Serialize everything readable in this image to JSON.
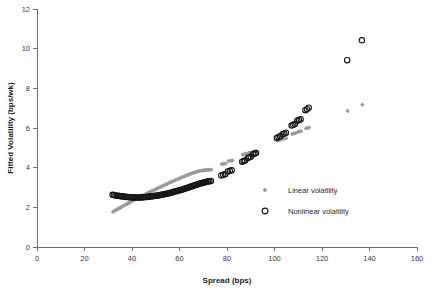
{
  "chart_data": {
    "type": "scatter",
    "title": "",
    "xlabel": "Spread (bps)",
    "ylabel": "Fitted Volatility (bps/wk)",
    "xlim": [
      0,
      160
    ],
    "ylim": [
      0,
      12
    ],
    "xticks": [
      0,
      20,
      40,
      60,
      80,
      100,
      120,
      140,
      160
    ],
    "yticks": [
      0,
      2,
      4,
      6,
      8,
      10,
      12
    ],
    "grid": false,
    "legend_position": "inside-lower-right",
    "series": [
      {
        "name": "Linear volatility",
        "marker": "diamond",
        "color": "#9a9a9a",
        "points": [
          [
            32.0,
            1.77
          ],
          [
            32.6,
            1.82
          ],
          [
            33.2,
            1.86
          ],
          [
            33.8,
            1.9
          ],
          [
            34.4,
            1.94
          ],
          [
            35.0,
            1.98
          ],
          [
            35.6,
            2.02
          ],
          [
            36.2,
            2.06
          ],
          [
            36.8,
            2.1
          ],
          [
            37.4,
            2.14
          ],
          [
            38.0,
            2.18
          ],
          [
            38.6,
            2.22
          ],
          [
            39.2,
            2.26
          ],
          [
            39.8,
            2.3
          ],
          [
            40.4,
            2.34
          ],
          [
            41.0,
            2.38
          ],
          [
            41.6,
            2.42
          ],
          [
            42.2,
            2.45
          ],
          [
            42.8,
            2.49
          ],
          [
            43.4,
            2.53
          ],
          [
            44.0,
            2.56
          ],
          [
            44.6,
            2.6
          ],
          [
            45.2,
            2.63
          ],
          [
            45.8,
            2.67
          ],
          [
            46.4,
            2.7
          ],
          [
            47.0,
            2.74
          ],
          [
            47.6,
            2.77
          ],
          [
            48.2,
            2.81
          ],
          [
            48.8,
            2.84
          ],
          [
            49.4,
            2.88
          ],
          [
            50.0,
            2.91
          ],
          [
            50.6,
            2.95
          ],
          [
            51.2,
            2.98
          ],
          [
            51.8,
            3.02
          ],
          [
            52.4,
            3.05
          ],
          [
            53.0,
            3.08
          ],
          [
            53.6,
            3.12
          ],
          [
            54.2,
            3.15
          ],
          [
            54.8,
            3.18
          ],
          [
            55.4,
            3.22
          ],
          [
            56.0,
            3.25
          ],
          [
            56.6,
            3.28
          ],
          [
            57.2,
            3.31
          ],
          [
            57.8,
            3.35
          ],
          [
            58.4,
            3.38
          ],
          [
            59.0,
            3.41
          ],
          [
            59.6,
            3.44
          ],
          [
            60.2,
            3.47
          ],
          [
            60.8,
            3.5
          ],
          [
            61.4,
            3.53
          ],
          [
            62.0,
            3.56
          ],
          [
            62.6,
            3.59
          ],
          [
            63.2,
            3.62
          ],
          [
            63.8,
            3.65
          ],
          [
            64.4,
            3.68
          ],
          [
            65.0,
            3.7
          ],
          [
            65.6,
            3.73
          ],
          [
            66.2,
            3.75
          ],
          [
            66.8,
            3.78
          ],
          [
            67.4,
            3.8
          ],
          [
            68.0,
            3.82
          ],
          [
            68.6,
            3.84
          ],
          [
            69.2,
            3.85
          ],
          [
            69.8,
            3.86
          ],
          [
            70.4,
            3.87
          ],
          [
            71.0,
            3.88
          ],
          [
            71.6,
            3.88
          ],
          [
            72.2,
            3.89
          ],
          [
            72.8,
            3.89
          ],
          [
            73.4,
            3.9
          ],
          [
            77.8,
            4.18
          ],
          [
            78.6,
            4.2
          ],
          [
            79.4,
            4.21
          ],
          [
            80.6,
            4.33
          ],
          [
            81.4,
            4.35
          ],
          [
            82.2,
            4.36
          ],
          [
            86.6,
            4.66
          ],
          [
            87.2,
            4.68
          ],
          [
            87.8,
            4.7
          ],
          [
            89.0,
            4.74
          ],
          [
            89.6,
            4.76
          ],
          [
            90.2,
            4.77
          ],
          [
            91.2,
            4.8
          ],
          [
            91.8,
            4.81
          ],
          [
            92.4,
            4.82
          ],
          [
            101.2,
            5.37
          ],
          [
            101.9,
            5.39
          ],
          [
            102.6,
            5.41
          ],
          [
            103.6,
            5.45
          ],
          [
            104.3,
            5.47
          ],
          [
            105.0,
            5.49
          ],
          [
            107.4,
            5.7
          ],
          [
            108.1,
            5.72
          ],
          [
            108.8,
            5.74
          ],
          [
            109.8,
            5.8
          ],
          [
            110.5,
            5.82
          ],
          [
            111.2,
            5.84
          ],
          [
            113.2,
            5.98
          ],
          [
            113.9,
            6.0
          ],
          [
            114.6,
            6.02
          ],
          [
            130.8,
            6.86
          ],
          [
            137.0,
            7.17
          ]
        ]
      },
      {
        "name": "Nonlinear volatility",
        "marker": "open-circle",
        "color": "#151515",
        "points": [
          [
            31.8,
            2.63
          ],
          [
            32.4,
            2.62
          ],
          [
            33.0,
            2.6
          ],
          [
            33.6,
            2.59
          ],
          [
            34.2,
            2.58
          ],
          [
            34.8,
            2.57
          ],
          [
            35.4,
            2.56
          ],
          [
            36.0,
            2.55
          ],
          [
            36.6,
            2.54
          ],
          [
            37.2,
            2.53
          ],
          [
            37.8,
            2.52
          ],
          [
            38.4,
            2.52
          ],
          [
            39.0,
            2.51
          ],
          [
            39.6,
            2.51
          ],
          [
            40.2,
            2.5
          ],
          [
            40.8,
            2.5
          ],
          [
            41.4,
            2.5
          ],
          [
            42.0,
            2.5
          ],
          [
            42.6,
            2.5
          ],
          [
            43.2,
            2.5
          ],
          [
            43.8,
            2.5
          ],
          [
            44.4,
            2.51
          ],
          [
            45.0,
            2.51
          ],
          [
            45.6,
            2.52
          ],
          [
            46.2,
            2.52
          ],
          [
            46.8,
            2.53
          ],
          [
            47.4,
            2.54
          ],
          [
            48.0,
            2.55
          ],
          [
            48.6,
            2.56
          ],
          [
            49.2,
            2.57
          ],
          [
            49.8,
            2.58
          ],
          [
            50.4,
            2.59
          ],
          [
            51.0,
            2.6
          ],
          [
            51.6,
            2.61
          ],
          [
            52.2,
            2.63
          ],
          [
            52.8,
            2.64
          ],
          [
            53.4,
            2.66
          ],
          [
            54.0,
            2.67
          ],
          [
            54.6,
            2.69
          ],
          [
            55.2,
            2.7
          ],
          [
            55.8,
            2.72
          ],
          [
            56.4,
            2.74
          ],
          [
            57.0,
            2.76
          ],
          [
            57.6,
            2.78
          ],
          [
            58.2,
            2.8
          ],
          [
            58.8,
            2.82
          ],
          [
            59.4,
            2.84
          ],
          [
            60.0,
            2.86
          ],
          [
            60.6,
            2.88
          ],
          [
            61.2,
            2.9
          ],
          [
            61.8,
            2.92
          ],
          [
            62.4,
            2.95
          ],
          [
            63.0,
            2.97
          ],
          [
            63.6,
            2.99
          ],
          [
            64.2,
            3.02
          ],
          [
            64.8,
            3.04
          ],
          [
            65.4,
            3.07
          ],
          [
            66.0,
            3.09
          ],
          [
            66.6,
            3.12
          ],
          [
            67.2,
            3.14
          ],
          [
            67.8,
            3.17
          ],
          [
            68.4,
            3.19
          ],
          [
            69.0,
            3.21
          ],
          [
            69.6,
            3.23
          ],
          [
            70.2,
            3.25
          ],
          [
            70.8,
            3.27
          ],
          [
            71.4,
            3.29
          ],
          [
            72.0,
            3.3
          ],
          [
            72.6,
            3.32
          ],
          [
            73.2,
            3.33
          ],
          [
            77.6,
            3.61
          ],
          [
            78.4,
            3.64
          ],
          [
            79.2,
            3.67
          ],
          [
            80.4,
            3.81
          ],
          [
            81.2,
            3.84
          ],
          [
            82.0,
            3.87
          ],
          [
            86.4,
            4.3
          ],
          [
            87.0,
            4.33
          ],
          [
            87.6,
            4.36
          ],
          [
            88.8,
            4.49
          ],
          [
            89.4,
            4.52
          ],
          [
            90.0,
            4.55
          ],
          [
            91.0,
            4.68
          ],
          [
            91.6,
            4.71
          ],
          [
            92.2,
            4.74
          ],
          [
            101.0,
            5.5
          ],
          [
            101.7,
            5.54
          ],
          [
            102.4,
            5.58
          ],
          [
            103.4,
            5.68
          ],
          [
            104.1,
            5.72
          ],
          [
            104.8,
            5.76
          ],
          [
            107.2,
            6.12
          ],
          [
            107.9,
            6.16
          ],
          [
            108.6,
            6.2
          ],
          [
            109.6,
            6.36
          ],
          [
            110.3,
            6.4
          ],
          [
            111.0,
            6.44
          ],
          [
            113.0,
            6.9
          ],
          [
            113.7,
            6.95
          ],
          [
            114.4,
            7.02
          ],
          [
            130.6,
            9.42
          ],
          [
            136.8,
            10.42
          ]
        ]
      }
    ]
  },
  "legend": {
    "items": [
      {
        "label": "Linear volatility",
        "marker": "diamond",
        "color": "#9a9a9a"
      },
      {
        "label": "Nonlinear volatility",
        "marker": "open-circle",
        "color": "#151515"
      }
    ]
  }
}
